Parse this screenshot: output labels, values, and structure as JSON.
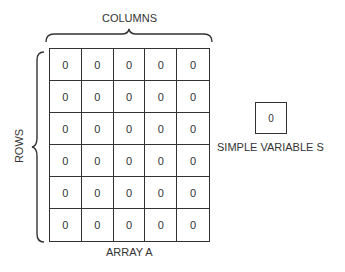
{
  "array": {
    "title": "ARRAY A",
    "columns_label": "COLUMNS",
    "rows_label": "ROWS",
    "cells": [
      [
        "0",
        "0",
        "0",
        "0",
        "0"
      ],
      [
        "0",
        "0",
        "0",
        "0",
        "0"
      ],
      [
        "0",
        "0",
        "0",
        "0",
        "0"
      ],
      [
        "0",
        "0",
        "0",
        "0",
        "0"
      ],
      [
        "0",
        "0",
        "0",
        "0",
        "0"
      ],
      [
        "0",
        "0",
        "0",
        "0",
        "0"
      ]
    ]
  },
  "simple_variable": {
    "value": "0",
    "label": "SIMPLE VARIABLE S"
  }
}
